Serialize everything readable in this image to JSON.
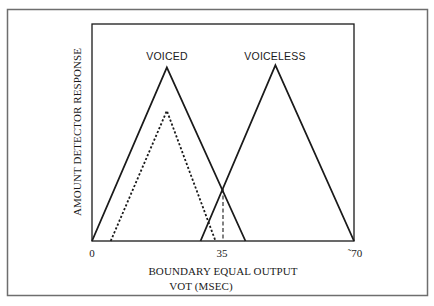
{
  "chart_data": {
    "type": "line",
    "title": "",
    "xlabel": "BOUNDARY EQUAL OUTPUT",
    "xlabel_line2": "VOT (MSEC)",
    "ylabel": "AMOUNT DETECTOR RESPONSE",
    "xlim": [
      0,
      70
    ],
    "ylim": [
      0,
      100
    ],
    "x_ticks": [
      0,
      35,
      70
    ],
    "x_tick_labels": [
      "0",
      "35",
      "˜70"
    ],
    "grid": false,
    "legend": "inline labels above peaks",
    "series": [
      {
        "name": "VOICED",
        "style": "solid",
        "x": [
          0,
          20,
          41
        ],
        "y": [
          0,
          80,
          0
        ]
      },
      {
        "name": "VOICED (reduced)",
        "style": "dotted",
        "x": [
          5,
          20,
          33
        ],
        "y": [
          0,
          60,
          0
        ]
      },
      {
        "name": "VOICELESS",
        "style": "solid",
        "x": [
          29,
          49,
          70
        ],
        "y": [
          0,
          81,
          0
        ]
      }
    ],
    "annotations": [
      {
        "type": "vertical-dashed-line",
        "x": 35,
        "y_from": 0,
        "y_to": 24,
        "meaning": "crossover / category boundary"
      },
      {
        "type": "text",
        "text": "VOICED",
        "x": 20,
        "position": "above peak"
      },
      {
        "type": "text",
        "text": "VOICELESS",
        "x": 49,
        "position": "above peak"
      }
    ]
  },
  "labels": {
    "voiced": "VOICED",
    "voiceless": "VOICELESS",
    "tick_0": "0",
    "tick_35": "35",
    "tick_70": "˜70",
    "xlabel_line1": "BOUNDARY EQUAL OUTPUT",
    "xlabel_line2": "VOT (MSEC)",
    "ylabel": "AMOUNT DETECTOR RESPONSE"
  },
  "colors": {
    "line": "#1a1a1a",
    "frame": "#1a1a1a",
    "outer_border": "#6e6e6e",
    "background": "#ffffff"
  }
}
